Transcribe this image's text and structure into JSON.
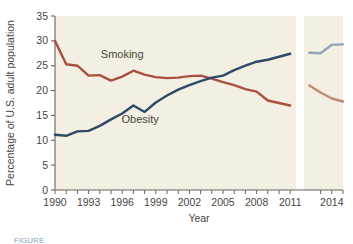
{
  "figure": {
    "background_color": "#ffffff",
    "plot_background_color": "#f4efe3",
    "axis_color": "#6b655c",
    "caption_label": "FIGURE"
  },
  "chart_data": {
    "type": "line",
    "title": "",
    "xlabel": "Year",
    "ylabel": "Percentage of U.S. adult population",
    "xlim": [
      1990,
      2015
    ],
    "ylim": [
      0,
      35
    ],
    "yticks": [
      0,
      5,
      10,
      15,
      20,
      25,
      30,
      35
    ],
    "ytick_labels": [
      "0",
      "5",
      "10",
      "15",
      "20",
      "25",
      "30",
      "35"
    ],
    "xticks": [
      1990,
      1993,
      1996,
      1999,
      2002,
      2005,
      2008,
      2011,
      2014
    ],
    "xtick_labels": [
      "1990",
      "1993",
      "1996",
      "1999",
      "2002",
      "2005",
      "2008",
      "2011",
      "2014"
    ],
    "xtick_minor_step": 1,
    "grid": false,
    "legend_position": "inline-annotations",
    "axis_break": {
      "present": true,
      "after_year": 2011,
      "before_year": 2012,
      "gap_color": "#ffffff"
    },
    "annotations": [
      {
        "text": "Smoking",
        "x": 1996.0,
        "y": 26.6
      },
      {
        "text": "Obesity",
        "x": 1997.6,
        "y": 13.4
      }
    ],
    "series": [
      {
        "name": "Smoking",
        "color": "#a9503f",
        "faded_color": "#c08a72",
        "x": [
          1990,
          1991,
          1992,
          1993,
          1994,
          1995,
          1996,
          1997,
          1998,
          1999,
          2000,
          2001,
          2002,
          2003,
          2004,
          2005,
          2006,
          2007,
          2008,
          2009,
          2010,
          2011
        ],
        "values": [
          30.0,
          25.3,
          25.0,
          23.0,
          23.1,
          22.0,
          22.8,
          24.0,
          23.2,
          22.7,
          22.5,
          22.6,
          22.9,
          23.0,
          22.4,
          21.7,
          21.1,
          20.3,
          19.8,
          18.0,
          17.5,
          17.0
        ],
        "x_continued": [
          2012,
          2013,
          2014,
          2015
        ],
        "values_continued": [
          21.0,
          19.6,
          18.4,
          17.8
        ]
      },
      {
        "name": "Obesity",
        "color": "#2e4a68",
        "faded_color": "#93a4b8",
        "x": [
          1990,
          1991,
          1992,
          1993,
          1994,
          1995,
          1996,
          1997,
          1998,
          1999,
          2000,
          2001,
          2002,
          2003,
          2004,
          2005,
          2006,
          2007,
          2008,
          2009,
          2010,
          2011
        ],
        "values": [
          11.1,
          10.9,
          11.8,
          11.9,
          12.9,
          14.2,
          15.4,
          17.0,
          15.7,
          17.6,
          19.0,
          20.2,
          21.1,
          21.9,
          22.6,
          23.0,
          24.1,
          25.0,
          25.8,
          26.2,
          26.8,
          27.4
        ],
        "x_continued": [
          2012,
          2013,
          2014,
          2015
        ],
        "values_continued": [
          27.6,
          27.5,
          29.2,
          29.3
        ]
      }
    ]
  }
}
